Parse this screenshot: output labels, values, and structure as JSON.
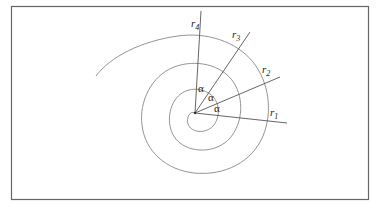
{
  "diagram": {
    "angle_label": "α",
    "radii": [
      {
        "label": "r",
        "sub": "1"
      },
      {
        "label": "r",
        "sub": "2"
      },
      {
        "label": "r",
        "sub": "3"
      },
      {
        "label": "r",
        "sub": "4"
      }
    ],
    "angles": [
      "α",
      "α",
      "α"
    ],
    "colors": {
      "line": "#777777",
      "border": "#666666",
      "text": "#222222"
    }
  }
}
